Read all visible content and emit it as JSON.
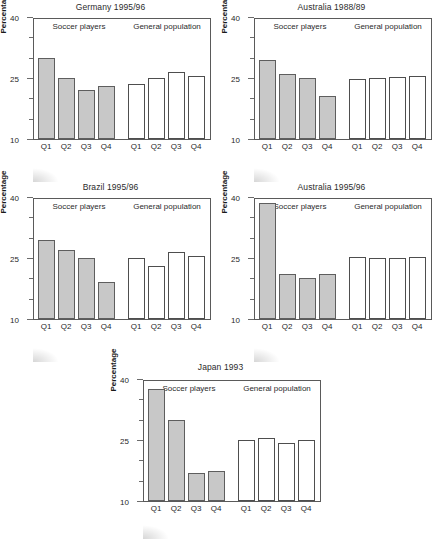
{
  "figure": {
    "ylabel": "Percentage",
    "panel_headings": {
      "left": "Soccer players",
      "right": "General population"
    },
    "y_ticks_labeled": [
      "40",
      "25",
      "10"
    ],
    "x_categories": [
      "Q1",
      "Q2",
      "Q3",
      "Q4"
    ]
  },
  "chart_data": [
    {
      "type": "bar",
      "title": "Germany 1995/96",
      "xlabel": "",
      "ylabel": "Percentage",
      "ylim": [
        10,
        40
      ],
      "yticks": [
        10,
        25,
        40
      ],
      "yticks_minor": [
        15,
        20,
        30,
        35
      ],
      "grid": false,
      "legend": "none",
      "categories": [
        "Q1",
        "Q2",
        "Q3",
        "Q4"
      ],
      "series": [
        {
          "name": "Soccer players",
          "values": [
            30.0,
            25.0,
            22.0,
            23.0
          ]
        },
        {
          "name": "General population",
          "values": [
            23.5,
            25.0,
            26.5,
            25.5
          ]
        }
      ]
    },
    {
      "type": "bar",
      "title": "Australia 1988/89",
      "xlabel": "",
      "ylabel": "Percentage",
      "ylim": [
        10,
        40
      ],
      "yticks": [
        10,
        25,
        40
      ],
      "yticks_minor": [
        15,
        20,
        30,
        35
      ],
      "grid": false,
      "legend": "none",
      "categories": [
        "Q1",
        "Q2",
        "Q3",
        "Q4"
      ],
      "series": [
        {
          "name": "Soccer players",
          "values": [
            29.5,
            26.0,
            25.0,
            20.5
          ]
        },
        {
          "name": "General population",
          "values": [
            24.8,
            25.0,
            25.2,
            25.5
          ]
        }
      ]
    },
    {
      "type": "bar",
      "title": "Brazil 1995/96",
      "xlabel": "",
      "ylabel": "Percentage",
      "ylim": [
        10,
        40
      ],
      "yticks": [
        10,
        25,
        40
      ],
      "yticks_minor": [
        15,
        20,
        30,
        35
      ],
      "grid": false,
      "legend": "none",
      "categories": [
        "Q1",
        "Q2",
        "Q3",
        "Q4"
      ],
      "series": [
        {
          "name": "Soccer players",
          "values": [
            29.5,
            27.0,
            25.0,
            19.0
          ]
        },
        {
          "name": "General population",
          "values": [
            25.0,
            23.0,
            26.5,
            25.5
          ]
        }
      ]
    },
    {
      "type": "bar",
      "title": "Australia 1995/96",
      "xlabel": "",
      "ylabel": "Percentage",
      "ylim": [
        10,
        40
      ],
      "yticks": [
        10,
        25,
        40
      ],
      "yticks_minor": [
        15,
        20,
        30,
        35
      ],
      "grid": false,
      "legend": "none",
      "categories": [
        "Q1",
        "Q2",
        "Q3",
        "Q4"
      ],
      "series": [
        {
          "name": "Soccer players",
          "values": [
            38.5,
            21.0,
            20.0,
            21.0
          ]
        },
        {
          "name": "General population",
          "values": [
            25.3,
            25.0,
            25.0,
            25.3
          ]
        }
      ]
    },
    {
      "type": "bar",
      "title": "Japan 1993",
      "xlabel": "",
      "ylabel": "Percentage",
      "ylim": [
        10,
        40
      ],
      "yticks": [
        10,
        25,
        40
      ],
      "yticks_minor": [
        15,
        20,
        30,
        35
      ],
      "grid": false,
      "legend": "none",
      "categories": [
        "Q1",
        "Q2",
        "Q3",
        "Q4"
      ],
      "series": [
        {
          "name": "Soccer players",
          "values": [
            37.5,
            30.0,
            17.0,
            17.5
          ]
        },
        {
          "name": "General population",
          "values": [
            25.0,
            25.6,
            24.3,
            25.0
          ]
        }
      ]
    }
  ],
  "colors": {
    "bar_filled": "#c8c8c8",
    "bar_open": "#ffffff",
    "axis": "#5a5a5a",
    "text": "#1f1f1f"
  }
}
